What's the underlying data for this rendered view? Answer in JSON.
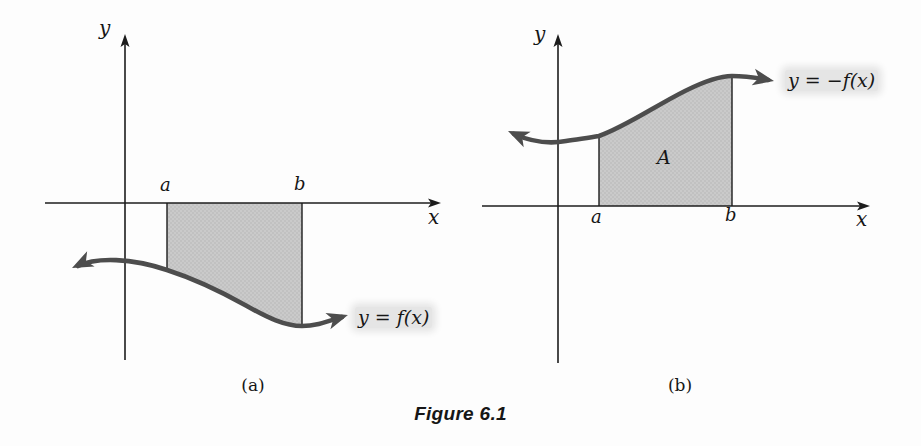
{
  "figure": {
    "caption": "Figure 6.1",
    "colors": {
      "background": "#fdfdfd",
      "axis": "#1c1c1c",
      "curve": "#4d4d4d",
      "shade": "#cacaca",
      "shade_dot": "#b2b2b2",
      "label_highlight": "#e5e5e5",
      "text": "#161616"
    },
    "panels": [
      {
        "sublabel": "(a)",
        "y_axis_label": "y",
        "x_axis_label": "x",
        "a_label": "a",
        "b_label": "b",
        "curve_label": "y = f(x)",
        "region_label": ""
      },
      {
        "sublabel": "(b)",
        "y_axis_label": "y",
        "x_axis_label": "x",
        "a_label": "a",
        "b_label": "b",
        "curve_label": "y = −f(x)",
        "region_label": "A"
      }
    ]
  }
}
